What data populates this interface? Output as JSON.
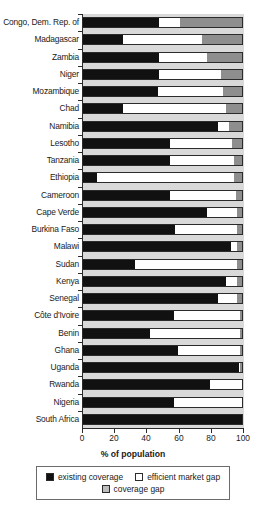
{
  "chart_data": {
    "type": "bar",
    "orientation": "horizontal",
    "stacked": true,
    "title": "",
    "xlabel": "% of population",
    "ylabel": "",
    "xlim": [
      0,
      100
    ],
    "xticks": [
      0,
      20,
      40,
      60,
      80,
      100
    ],
    "xtick_labels": [
      "0",
      "20",
      "40",
      "60",
      "80",
      "100"
    ],
    "grid": false,
    "legend_position": "bottom",
    "categories": [
      "Congo, Dem. Rep. of",
      "Madagascar",
      "Zambia",
      "Niger",
      "Mozambique",
      "Chad",
      "Namibia",
      "Lesotho",
      "Tanzania",
      "Ethiopia",
      "Cameroon",
      "Cape Verde",
      "Burkina Faso",
      "Malawi",
      "Sudan",
      "Kenya",
      "Senegal",
      "Côte d'Ivoire",
      "Benin",
      "Ghana",
      "Uganda",
      "Rwanda",
      "Nigeria",
      "South Africa"
    ],
    "series": [
      {
        "name": "existing coverage",
        "color": "#111111",
        "values": [
          48,
          25,
          48,
          48,
          47,
          25,
          85,
          55,
          55,
          9,
          55,
          78,
          58,
          93,
          33,
          90,
          85,
          57,
          42,
          60,
          98,
          80,
          57,
          100
        ]
      },
      {
        "name": "efficient market gap",
        "color": "#ffffff",
        "values": [
          13,
          50,
          30,
          39,
          41,
          65,
          7,
          39,
          40,
          86,
          41,
          19,
          39,
          4,
          64,
          7,
          12,
          42,
          57,
          39,
          1,
          20,
          43,
          0
        ]
      },
      {
        "name": "coverage gap",
        "color": "#8e8e8e",
        "values": [
          39,
          25,
          22,
          13,
          12,
          10,
          8,
          6,
          5,
          5,
          4,
          3,
          3,
          3,
          3,
          3,
          3,
          1,
          1,
          1,
          1,
          0,
          0,
          0
        ]
      }
    ]
  },
  "legend": {
    "items": [
      {
        "label": "existing coverage",
        "swatch": "existing"
      },
      {
        "label": "efficient market gap",
        "swatch": "market"
      },
      {
        "label": "coverage gap",
        "swatch": "gap"
      }
    ]
  }
}
